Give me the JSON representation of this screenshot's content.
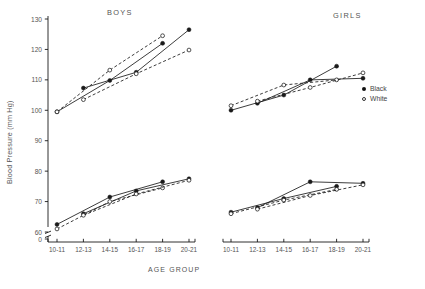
{
  "chart_data": {
    "type": "line",
    "title": "",
    "xlabel": "AGE GROUP",
    "ylabel": "Blood Pressure (mm Hg)",
    "categories": [
      "10-11",
      "12-13",
      "14-15",
      "16-17",
      "18-19",
      "20-21"
    ],
    "yticks": [
      130,
      120,
      110,
      100,
      90,
      80,
      70,
      60,
      0
    ],
    "ylim": [
      60,
      132
    ],
    "axis_break": true,
    "grid": false,
    "legend": {
      "position": "right",
      "entries": [
        {
          "label": "Black",
          "marker": "filled-circle"
        },
        {
          "label": "White",
          "marker": "open-circle"
        }
      ]
    },
    "panels": [
      {
        "name": "BOYS",
        "series": [
          {
            "name": "Black systolic A",
            "race": "Black",
            "measure": "systolic",
            "marker": "filled-circle",
            "linestyle": "solid",
            "x": [
              "10-11",
              "14-15",
              "18-19"
            ],
            "y": [
              99.5,
              109.8,
              122.0
            ]
          },
          {
            "name": "Black systolic B",
            "race": "Black",
            "measure": "systolic",
            "marker": "filled-circle",
            "linestyle": "solid",
            "x": [
              "12-13",
              "16-17",
              "20-21"
            ],
            "y": [
              107.3,
              112.5,
              126.5
            ]
          },
          {
            "name": "White systolic A",
            "race": "White",
            "measure": "systolic",
            "marker": "open-circle",
            "linestyle": "dashed",
            "x": [
              "10-11",
              "14-15",
              "18-19"
            ],
            "y": [
              99.5,
              113.2,
              124.5
            ]
          },
          {
            "name": "White systolic B",
            "race": "White",
            "measure": "systolic",
            "marker": "open-circle",
            "linestyle": "dashed",
            "x": [
              "12-13",
              "16-17",
              "20-21"
            ],
            "y": [
              103.5,
              112.0,
              119.8
            ]
          },
          {
            "name": "Black diastolic A",
            "race": "Black",
            "measure": "diastolic",
            "marker": "filled-circle",
            "linestyle": "solid",
            "x": [
              "10-11",
              "14-15",
              "18-19"
            ],
            "y": [
              62.5,
              71.5,
              76.5
            ]
          },
          {
            "name": "Black diastolic B",
            "race": "Black",
            "measure": "diastolic",
            "marker": "filled-circle",
            "linestyle": "solid",
            "x": [
              "12-13",
              "16-17",
              "20-21"
            ],
            "y": [
              66.0,
              73.5,
              77.5
            ]
          },
          {
            "name": "White diastolic A",
            "race": "White",
            "measure": "diastolic",
            "marker": "open-circle",
            "linestyle": "dashed",
            "x": [
              "10-11",
              "14-15",
              "18-19"
            ],
            "y": [
              61.0,
              70.0,
              74.5
            ]
          },
          {
            "name": "White diastolic B",
            "race": "White",
            "measure": "diastolic",
            "marker": "open-circle",
            "linestyle": "dashed",
            "x": [
              "12-13",
              "16-17",
              "20-21"
            ],
            "y": [
              65.5,
              72.5,
              77.0
            ]
          }
        ]
      },
      {
        "name": "GIRLS",
        "series": [
          {
            "name": "Black systolic A",
            "race": "Black",
            "measure": "systolic",
            "marker": "filled-circle",
            "linestyle": "solid",
            "x": [
              "10-11",
              "14-15",
              "18-19"
            ],
            "y": [
              100.0,
              105.0,
              114.5
            ]
          },
          {
            "name": "Black systolic B",
            "race": "Black",
            "measure": "systolic",
            "marker": "filled-circle",
            "linestyle": "solid",
            "x": [
              "12-13",
              "16-17",
              "20-21"
            ],
            "y": [
              102.3,
              110.0,
              110.5
            ]
          },
          {
            "name": "White systolic A",
            "race": "White",
            "measure": "systolic",
            "marker": "open-circle",
            "linestyle": "dashed",
            "x": [
              "10-11",
              "14-15",
              "18-19"
            ],
            "y": [
              101.5,
              108.3,
              110.0
            ]
          },
          {
            "name": "White systolic B",
            "race": "White",
            "measure": "systolic",
            "marker": "open-circle",
            "linestyle": "dashed",
            "x": [
              "12-13",
              "16-17",
              "20-21"
            ],
            "y": [
              103.0,
              107.5,
              112.3
            ]
          },
          {
            "name": "Black diastolic A",
            "race": "Black",
            "measure": "diastolic",
            "marker": "filled-circle",
            "linestyle": "solid",
            "x": [
              "10-11",
              "14-15",
              "18-19"
            ],
            "y": [
              66.5,
              71.0,
              75.0
            ]
          },
          {
            "name": "Black diastolic B",
            "race": "Black",
            "measure": "diastolic",
            "marker": "filled-circle",
            "linestyle": "solid",
            "x": [
              "12-13",
              "16-17",
              "20-21"
            ],
            "y": [
              68.0,
              76.5,
              76.0
            ]
          },
          {
            "name": "White diastolic A",
            "race": "White",
            "measure": "diastolic",
            "marker": "open-circle",
            "linestyle": "dashed",
            "x": [
              "10-11",
              "14-15",
              "18-19"
            ],
            "y": [
              66.0,
              70.5,
              74.0
            ]
          },
          {
            "name": "White diastolic B",
            "race": "White",
            "measure": "diastolic",
            "marker": "open-circle",
            "linestyle": "dashed",
            "x": [
              "12-13",
              "16-17",
              "20-21"
            ],
            "y": [
              67.5,
              72.0,
              75.5
            ]
          }
        ]
      }
    ]
  },
  "colors": {
    "ink": "#1a1a1a",
    "text": "#555555",
    "background": "#ffffff"
  }
}
